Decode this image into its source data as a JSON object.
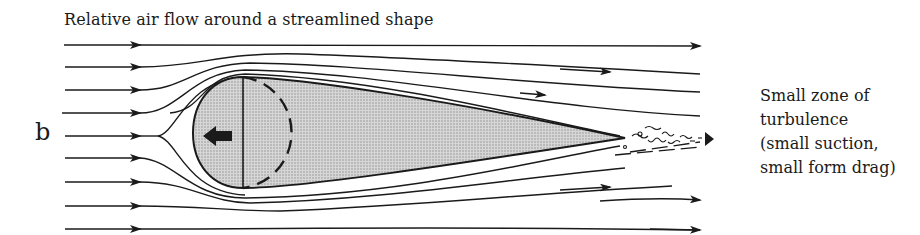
{
  "diagram": {
    "title": "Relative air flow around a streamlined shape",
    "panel_label": "b",
    "annotation": {
      "lines": [
        "Small zone of",
        "turbulence",
        "(small suction,",
        "small form drag)"
      ]
    },
    "elements": {
      "body": "streamlined teardrop shape (shaded)",
      "motion_arrow": "left-pointing arrow inside body",
      "dashed_circle": "dashed circle outline inside front of body",
      "wake": "small turbulent wake at tail"
    },
    "streamline_count": 9,
    "colors": {
      "line": "#1a1a1a",
      "body_fill": "#c8c8c8",
      "background": "#ffffff"
    }
  }
}
